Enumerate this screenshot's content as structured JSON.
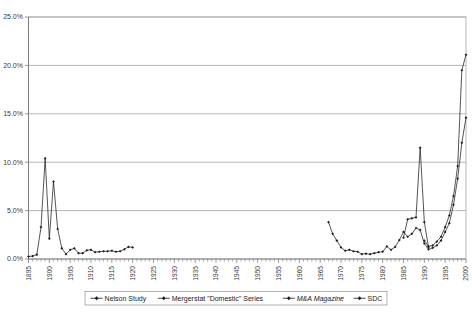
{
  "chart_data": {
    "type": "line",
    "title": "",
    "subtitle": "",
    "xlabel": "",
    "ylabel": "",
    "xlim": [
      1895,
      2000
    ],
    "ylim": [
      0,
      25
    ],
    "y_ticks": [
      "0.0%",
      "5.0%",
      "10.0%",
      "15.0%",
      "20.0%",
      "25.0%"
    ],
    "y_tick_values": [
      0,
      5,
      10,
      15,
      20,
      25
    ],
    "x_ticks": [
      "1895",
      "1900",
      "1905",
      "1910",
      "1915",
      "1920",
      "1925",
      "1930",
      "1935",
      "1940",
      "1945",
      "1950",
      "1955",
      "1960",
      "1965",
      "1970",
      "1975",
      "1980",
      "1985",
      "1990",
      "1995",
      "2000"
    ],
    "x_tick_values": [
      1895,
      1900,
      1905,
      1910,
      1915,
      1920,
      1925,
      1930,
      1935,
      1940,
      1945,
      1950,
      1955,
      1960,
      1965,
      1970,
      1975,
      1980,
      1985,
      1990,
      1995,
      2000
    ],
    "x_tick_rotation": -90,
    "x_minor_tick_interval": 1,
    "grid": "horizontal",
    "legend_position": "bottom",
    "marker": "diamond",
    "series": [
      {
        "name": "Nelson Study",
        "x": [
          1895,
          1896,
          1897,
          1898,
          1899,
          1900,
          1901,
          1902,
          1903,
          1904,
          1905,
          1906,
          1907,
          1908,
          1909,
          1910,
          1911,
          1912,
          1913,
          1914,
          1915,
          1916,
          1917,
          1918,
          1919,
          1920
        ],
        "values": [
          0.25,
          0.3,
          0.45,
          3.3,
          10.4,
          2.1,
          8.0,
          3.1,
          1.1,
          0.5,
          0.95,
          1.1,
          0.6,
          0.6,
          0.9,
          0.95,
          0.7,
          0.75,
          0.8,
          0.8,
          0.85,
          0.75,
          0.8,
          1.0,
          1.25,
          1.2
        ]
      },
      {
        "name": "Mergerstat \"Domestic\" Series",
        "x": [
          1967,
          1968,
          1969,
          1970,
          1971,
          1972,
          1973,
          1974,
          1975,
          1976,
          1977,
          1978,
          1979,
          1980,
          1981,
          1982,
          1983,
          1984,
          1985,
          1986,
          1987,
          1988,
          1989,
          1990,
          1991,
          1992,
          1993,
          1994,
          1995,
          1996,
          1997,
          1998,
          1999,
          2000
        ],
        "values": [
          3.8,
          2.6,
          1.9,
          1.2,
          0.85,
          0.95,
          0.8,
          0.75,
          0.5,
          0.55,
          0.5,
          0.6,
          0.7,
          0.75,
          1.3,
          0.95,
          1.25,
          1.95,
          2.8,
          2.3,
          2.6,
          3.2,
          3.0,
          1.6,
          1.0,
          1.15,
          1.4,
          1.9,
          2.8,
          3.7,
          5.6,
          8.3,
          12.0,
          14.6
        ]
      },
      {
        "name": "M&A Magazine",
        "x": [
          1985,
          1986,
          1987,
          1988,
          1989,
          1990,
          1991
        ],
        "values": [
          2.2,
          4.1,
          4.2,
          4.3,
          11.5,
          3.8,
          1.25
        ]
      },
      {
        "name": "SDC",
        "x": [
          1990,
          1991,
          1992,
          1993,
          1994,
          1995,
          1996,
          1997,
          1998,
          1999,
          2000
        ],
        "values": [
          1.9,
          1.3,
          1.4,
          1.8,
          2.3,
          3.3,
          4.5,
          6.5,
          9.6,
          19.5,
          21.1
        ]
      }
    ],
    "legend_entries": [
      {
        "label": "Nelson Study",
        "italic": false
      },
      {
        "label": "Mergerstat \"Domestic\" Series",
        "italic": false
      },
      {
        "label": "M&A Magazine",
        "italic": true
      },
      {
        "label": "SDC",
        "italic": false
      }
    ],
    "colors": {
      "line": "#1c1c1c",
      "gridline": "#9a9a9a",
      "border": "#a8a8a8",
      "text": "#3a3a3a",
      "background": "#ffffff"
    }
  }
}
